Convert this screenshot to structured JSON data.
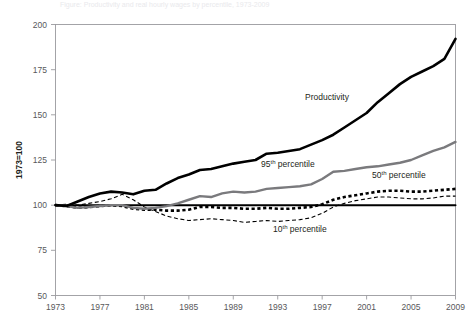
{
  "figure": {
    "cropped_title": "Figure: Productivity and real hourly wages by percentile, 1973-2009",
    "axis_label_y": "1973=100"
  },
  "chart_data": {
    "type": "line",
    "title": "",
    "xlabel": "",
    "ylabel": "1973=100",
    "xlim": [
      1973,
      2009
    ],
    "ylim": [
      50,
      200
    ],
    "grid": false,
    "legend": "inline-annotations",
    "ytick_labels": [
      "50",
      "75",
      "100",
      "125",
      "150",
      "175",
      "200"
    ],
    "ytick_values": [
      50,
      75,
      100,
      125,
      150,
      175,
      200
    ],
    "xtick_labels": [
      "1973",
      "1977",
      "1981",
      "1985",
      "1989",
      "1993",
      "1997",
      "2001",
      "2005",
      "2009"
    ],
    "xtick_values": [
      1973,
      1977,
      1981,
      1985,
      1989,
      1993,
      1997,
      2001,
      2005,
      2009
    ],
    "x": [
      1973,
      1974,
      1975,
      1976,
      1977,
      1978,
      1979,
      1980,
      1981,
      1982,
      1983,
      1984,
      1985,
      1986,
      1987,
      1988,
      1989,
      1990,
      1991,
      1992,
      1993,
      1994,
      1995,
      1996,
      1997,
      1998,
      1999,
      2000,
      2001,
      2002,
      2003,
      2004,
      2005,
      2006,
      2007,
      2008,
      2009
    ],
    "series": [
      {
        "name": "Productivity",
        "label": "Productivity",
        "color": "#000000",
        "style": "solid",
        "width": 2.6,
        "values": [
          100,
          99.5,
          102,
          104.5,
          106.5,
          107.5,
          107,
          106,
          108,
          108.5,
          112,
          115,
          117,
          119.5,
          120,
          121.5,
          123,
          124,
          125,
          128.5,
          129,
          130,
          131,
          133.5,
          136,
          139,
          143,
          147,
          151,
          157,
          162,
          167,
          171,
          174,
          177,
          181,
          192
        ],
        "final_value": 192
      },
      {
        "name": "95th percentile",
        "label": "95<sup>th</sup> percentile",
        "label_plain": "95th percentile",
        "color": "#7a7a7d",
        "style": "solid",
        "width": 2.4,
        "values": [
          100,
          99.5,
          98.5,
          99,
          99.5,
          100,
          100,
          98.5,
          98,
          98.5,
          99.5,
          101,
          103,
          105,
          104.5,
          106.5,
          107.5,
          107,
          107.5,
          109,
          109.5,
          110,
          110.5,
          111.5,
          114.5,
          118.5,
          119,
          120,
          121,
          121.5,
          122.5,
          123.5,
          125,
          127.5,
          130,
          132,
          135
        ],
        "final_value": 135
      },
      {
        "name": "50th percentile",
        "label": "50<sup>th</sup> percentile",
        "label_plain": "50th percentile",
        "color": "#000000",
        "style": "dotted-bold",
        "width": 2.6,
        "values": [
          100,
          99.5,
          98.5,
          99,
          99.5,
          100,
          99.5,
          98,
          97.5,
          97.5,
          97,
          97,
          97.5,
          99,
          99,
          98.5,
          98.5,
          98,
          98,
          98.5,
          98,
          98,
          98.5,
          99,
          100.5,
          103,
          104.5,
          105.5,
          106.5,
          107.5,
          108,
          108,
          107.5,
          107.5,
          108,
          108.5,
          109
        ],
        "final_value": 109
      },
      {
        "name": "10th percentile",
        "label": "10<sup>th</sup> percentile",
        "label_plain": "10th percentile",
        "color": "#000000",
        "style": "dashed-thin",
        "width": 1.1,
        "values": [
          100,
          100.5,
          100,
          101,
          102,
          103.5,
          106,
          103,
          99,
          96.5,
          94,
          92.5,
          91.5,
          92,
          92.5,
          92,
          91.5,
          90.5,
          91,
          91.5,
          91,
          91.5,
          92,
          93,
          95.5,
          99,
          101,
          102.5,
          103.5,
          104.5,
          104.5,
          104,
          103.5,
          103.5,
          104,
          105,
          105
        ],
        "final_value": 105
      },
      {
        "name": "baseline 100",
        "label": "",
        "color": "#000000",
        "style": "solid",
        "width": 2.0,
        "reference_value": 100,
        "values": [
          100,
          100,
          100,
          100,
          100,
          100,
          100,
          100,
          100,
          100,
          100,
          100,
          100,
          100,
          100,
          100,
          100,
          100,
          100,
          100,
          100,
          100,
          100,
          100,
          100,
          100,
          100,
          100,
          100,
          100,
          100,
          100,
          100,
          100,
          100,
          100,
          100
        ]
      }
    ],
    "annotations": [
      {
        "name": "productivity",
        "text": "Productivity",
        "x": 1997,
        "y": 146
      },
      {
        "name": "p95",
        "text": "95th percentile",
        "x": 1994,
        "y": 116
      },
      {
        "name": "p50",
        "text": "50th percentile",
        "x": 2005,
        "y": 114
      },
      {
        "name": "p10",
        "text": "10th percentile",
        "x": 1998,
        "y": 84
      }
    ]
  }
}
